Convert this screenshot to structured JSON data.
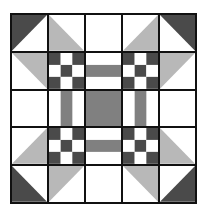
{
  "quilt": {
    "title": "",
    "grid_size": 5,
    "colors": {
      "dark": "#4a4a4a",
      "light": "#b8b8b8",
      "mid": "#808080",
      "white": "#ffffff",
      "line": "#111111"
    },
    "cells": [
      [
        {
          "type": "half-triangle",
          "color": "dark",
          "corner": "top-left"
        },
        {
          "type": "half-triangle",
          "color": "light",
          "corner": "bottom-left"
        },
        {
          "type": "blank"
        },
        {
          "type": "half-triangle",
          "color": "light",
          "corner": "bottom-right"
        },
        {
          "type": "half-triangle",
          "color": "dark",
          "corner": "top-right"
        }
      ],
      [
        {
          "type": "half-triangle",
          "color": "light",
          "corner": "top-right"
        },
        {
          "type": "nine-patch"
        },
        {
          "type": "h-strip"
        },
        {
          "type": "nine-patch"
        },
        {
          "type": "half-triangle",
          "color": "light",
          "corner": "top-left"
        }
      ],
      [
        {
          "type": "blank"
        },
        {
          "type": "v-strip"
        },
        {
          "type": "solid",
          "color": "mid"
        },
        {
          "type": "v-strip"
        },
        {
          "type": "blank"
        }
      ],
      [
        {
          "type": "half-triangle",
          "color": "light",
          "corner": "bottom-right"
        },
        {
          "type": "nine-patch"
        },
        {
          "type": "h-strip"
        },
        {
          "type": "nine-patch"
        },
        {
          "type": "half-triangle",
          "color": "light",
          "corner": "bottom-left"
        }
      ],
      [
        {
          "type": "half-triangle",
          "color": "dark",
          "corner": "bottom-left"
        },
        {
          "type": "half-triangle",
          "color": "light",
          "corner": "top-left"
        },
        {
          "type": "blank"
        },
        {
          "type": "half-triangle",
          "color": "light",
          "corner": "top-right"
        },
        {
          "type": "half-triangle",
          "color": "dark",
          "corner": "bottom-right"
        }
      ]
    ]
  }
}
